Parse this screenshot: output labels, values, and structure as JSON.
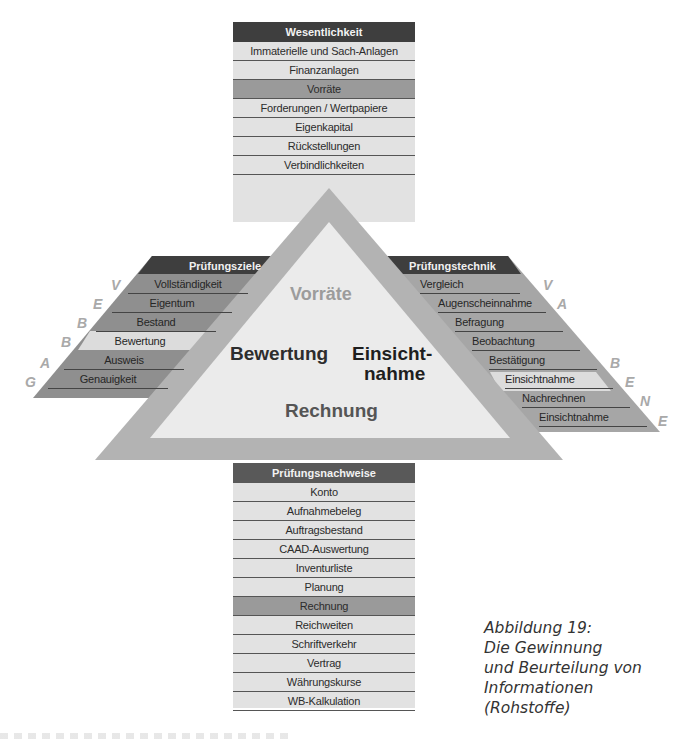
{
  "top_column": {
    "header": "Wesentlichkeit",
    "items": [
      {
        "label": "Immaterielle und Sach-Anlagen",
        "highlight": false
      },
      {
        "label": "Finanzanlagen",
        "highlight": false
      },
      {
        "label": "Vorräte",
        "highlight": true
      },
      {
        "label": "Forderungen / Wertpapiere",
        "highlight": false
      },
      {
        "label": "Eigenkapital",
        "highlight": false
      },
      {
        "label": "Rückstellungen",
        "highlight": false
      },
      {
        "label": "Verbindlichkeiten",
        "highlight": false
      }
    ]
  },
  "left_panel": {
    "header": "Prüfungsziele",
    "items": [
      {
        "label": "Vollständigkeit",
        "letter": "V",
        "highlight": false
      },
      {
        "label": "Eigentum",
        "letter": "E",
        "highlight": false
      },
      {
        "label": "Bestand",
        "letter": "B",
        "highlight": false
      },
      {
        "label": "Bewertung",
        "letter": "B",
        "highlight": true
      },
      {
        "label": "Ausweis",
        "letter": "A",
        "highlight": false
      },
      {
        "label": "Genauigkeit",
        "letter": "G",
        "highlight": false
      }
    ]
  },
  "right_panel": {
    "header": "Prüfungstechnik",
    "items": [
      {
        "label": "Vergleich",
        "highlight": false
      },
      {
        "label": "Augenscheinnahme",
        "highlight": false
      },
      {
        "label": "Befragung",
        "highlight": false
      },
      {
        "label": "Beobachtung",
        "highlight": false
      },
      {
        "label": "Bestätigung",
        "highlight": false
      },
      {
        "label": "Einsichtnahme",
        "highlight": true
      },
      {
        "label": "Nachrechnen",
        "highlight": false
      },
      {
        "label": "Einsichtnahme",
        "highlight": false
      }
    ],
    "letters": [
      "V",
      "A",
      "B",
      "E",
      "N",
      "E"
    ]
  },
  "triangle": {
    "top": "Vorräte",
    "left": "Bewertung",
    "right_line1": "Einsicht-",
    "right_line2": "nahme",
    "bottom": "Rechnung"
  },
  "bottom_column": {
    "header": "Prüfungsnachweise",
    "items": [
      {
        "label": "Konto",
        "highlight": false
      },
      {
        "label": "Aufnahmebeleg",
        "highlight": false
      },
      {
        "label": "Auftragsbestand",
        "highlight": false
      },
      {
        "label": "CAAD-Auswertung",
        "highlight": false
      },
      {
        "label": "Inventurliste",
        "highlight": false
      },
      {
        "label": "Planung",
        "highlight": false
      },
      {
        "label": "Rechnung",
        "highlight": true
      },
      {
        "label": "Reichweiten",
        "highlight": false
      },
      {
        "label": "Schriftverkehr",
        "highlight": false
      },
      {
        "label": "Vertrag",
        "highlight": false
      },
      {
        "label": "Währungskurse",
        "highlight": false
      },
      {
        "label": "WB-Kalkulation",
        "highlight": false
      }
    ]
  },
  "caption": {
    "line1": "Abbildung 19:",
    "line2": "Die Gewinnung",
    "line3": "und Beurteilung von",
    "line4": "Informationen",
    "line5": "(Rohstoffe)"
  },
  "colors": {
    "header_dark": "#3e3e3e",
    "column_bg": "#e2e2e2",
    "highlight": "#9a9a9a",
    "panel_bg": "#8f8f8f",
    "band": "#b3b3b3",
    "triangle_fill": "#ebebeb",
    "letter": "#a9a9a9"
  }
}
